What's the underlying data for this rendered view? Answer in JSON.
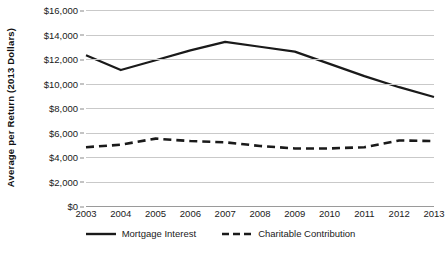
{
  "chart_data": {
    "type": "line",
    "title": "",
    "xlabel": "",
    "ylabel": "Average per Return (2013 Dollars)",
    "categories": [
      "2003",
      "2004",
      "2005",
      "2006",
      "2007",
      "2008",
      "2009",
      "2010",
      "2011",
      "2012",
      "2013"
    ],
    "ylim": [
      0,
      16000
    ],
    "ytick_values": [
      0,
      2000,
      4000,
      6000,
      8000,
      10000,
      12000,
      14000,
      16000
    ],
    "ytick_labels": [
      "$0",
      "$2,000",
      "$4,000",
      "$6,000",
      "$8,000",
      "$10,000",
      "$12,000",
      "$14,000",
      "$16,000"
    ],
    "grid": "horizontal",
    "legend_position": "bottom",
    "series": [
      {
        "name": "Mortgage Interest",
        "style": "solid",
        "color": "#1a1a1a",
        "values": [
          12300,
          11100,
          11900,
          12700,
          13400,
          13000,
          12600,
          11600,
          10600,
          9700,
          8900
        ]
      },
      {
        "name": "Charitable Contribution",
        "style": "dashed",
        "color": "#1a1a1a",
        "values": [
          4800,
          5000,
          5500,
          5300,
          5200,
          4900,
          4700,
          4700,
          4800,
          5350,
          5300
        ]
      }
    ]
  }
}
